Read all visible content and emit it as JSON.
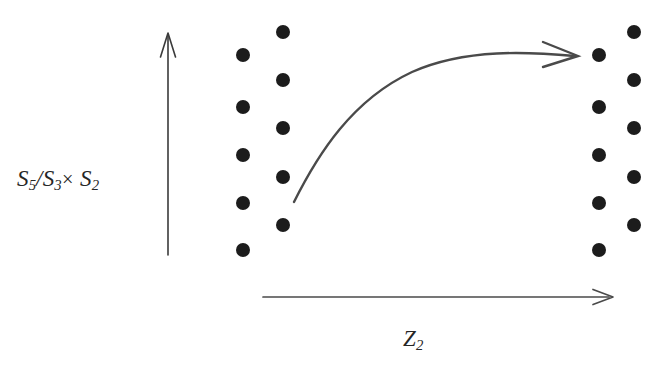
{
  "figure": {
    "width": 667,
    "height": 368,
    "background_color": "#ffffff",
    "ink_color": "#262626",
    "dot_color": "#1c1c1c",
    "type": "schematic-plot"
  },
  "axes": {
    "y_axis": {
      "label_html": "S<sub>5</sub>/S<sub>3</sub><span class=\"op\">×</span>&nbsp;S<sub>2</sub>",
      "label_text": "S5/S3× S2",
      "arrow": {
        "x": 168,
        "y_start": 255,
        "y_end": 33,
        "direction": "up"
      }
    },
    "x_axis": {
      "label_html": "Z<sub>2</sub>",
      "label_text": "Z2",
      "arrow": {
        "y": 297,
        "x_start": 263,
        "x_end": 613,
        "direction": "right"
      }
    }
  },
  "chart_data": {
    "type": "scatter",
    "title": "",
    "xlabel": "Z2",
    "ylabel": "S5/S3× S2",
    "grid": false,
    "legend": null,
    "annotations": [
      {
        "name": "transition-arrow",
        "kind": "curved-arrow",
        "start": [
          294,
          202
        ],
        "end": [
          578,
          56
        ],
        "control_points": [
          [
            330,
            120
          ],
          [
            430,
            58
          ]
        ],
        "arrowhead": "open-v"
      }
    ],
    "series": [
      {
        "name": "left-cluster-outer-column",
        "marker": "filled-circle",
        "marker_size": 14,
        "points": [
          [
            243,
            55
          ],
          [
            243,
            107
          ],
          [
            243,
            155
          ],
          [
            243,
            203
          ],
          [
            243,
            250
          ]
        ]
      },
      {
        "name": "left-cluster-inner-column",
        "marker": "filled-circle",
        "marker_size": 14,
        "points": [
          [
            283,
            32
          ],
          [
            283,
            80
          ],
          [
            283,
            128
          ],
          [
            283,
            177
          ],
          [
            283,
            225
          ]
        ]
      },
      {
        "name": "right-cluster-inner-column",
        "marker": "filled-circle",
        "marker_size": 14,
        "points": [
          [
            599,
            55
          ],
          [
            599,
            107
          ],
          [
            599,
            155
          ],
          [
            599,
            203
          ],
          [
            599,
            250
          ]
        ]
      },
      {
        "name": "right-cluster-outer-column",
        "marker": "filled-circle",
        "marker_size": 14,
        "points": [
          [
            634,
            32
          ],
          [
            634,
            80
          ],
          [
            634,
            128
          ],
          [
            634,
            177
          ],
          [
            634,
            225
          ]
        ]
      }
    ]
  }
}
